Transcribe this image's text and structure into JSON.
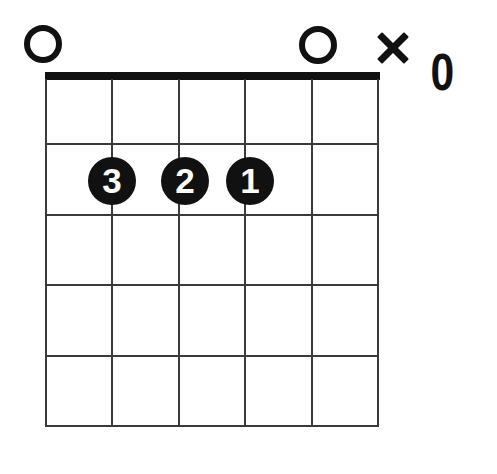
{
  "diagram": {
    "type": "guitar-chord-diagram",
    "strings_count": 6,
    "frets_count": 5,
    "starting_fret": 1,
    "nut_shown": true,
    "colors": {
      "ink": "#111111",
      "grid": "#3a3a3a",
      "background": "#ffffff",
      "dot_text": "#ffffff"
    },
    "top_markers": [
      {
        "string": 1,
        "symbol": "open-circle",
        "label": "O",
        "name": "open-string-marker-1"
      },
      {
        "string": 5,
        "symbol": "open-circle",
        "label": "O",
        "name": "open-string-marker-5"
      },
      {
        "string": 6,
        "symbol": "x",
        "label": "X",
        "name": "muted-string-marker-6"
      }
    ],
    "extra_label": {
      "text": "0",
      "name": "fret-number-label"
    },
    "finger_dots": [
      {
        "finger": "3",
        "string": 2,
        "fret": 2
      },
      {
        "finger": "2",
        "string": 3,
        "fret": 2
      },
      {
        "finger": "1",
        "string": 4,
        "fret": 2
      }
    ]
  }
}
